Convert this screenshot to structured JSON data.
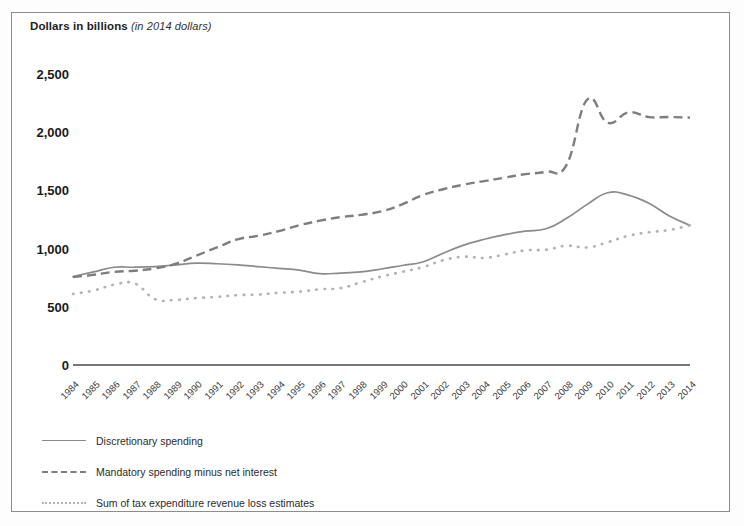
{
  "figure": {
    "axis_title_main": "Dollars in billions",
    "axis_title_units": "(in 2014 dollars)",
    "frame_color": "#8d8d8d",
    "background": "#ffffff"
  },
  "legend": {
    "position": "below-plot",
    "items": [
      {
        "label": "Discretionary spending",
        "marker": "solid-line",
        "color": "#8b8b8b"
      },
      {
        "label": "Mandatory spending minus net interest",
        "marker": "dashed-line",
        "color": "#7e7e7e"
      },
      {
        "label": "Sum of tax expenditure revenue loss estimates",
        "marker": "dotted-line",
        "color": "#b2b2b2"
      }
    ]
  },
  "chart_data": {
    "type": "line",
    "title": "Dollars in billions (in 2014 dollars)",
    "xlabel": "",
    "ylabel": "Dollars in billions",
    "ylim": [
      0,
      2500
    ],
    "yticks": [
      "0",
      "500",
      "1,000",
      "1,500",
      "2,000",
      "2,500"
    ],
    "ytick_values": [
      0,
      500,
      1000,
      1500,
      2000,
      2500
    ],
    "grid": false,
    "legend_position": "below",
    "x": [
      "1984",
      "1985",
      "1986",
      "1987",
      "1988",
      "1989",
      "1990",
      "1991",
      "1992",
      "1993",
      "1994",
      "1995",
      "1996",
      "1997",
      "1998",
      "1999",
      "2000",
      "2001",
      "2002",
      "2003",
      "2004",
      "2005",
      "2006",
      "2007",
      "2008",
      "2009",
      "2010",
      "2011",
      "2012",
      "2013",
      "2014"
    ],
    "series": [
      {
        "name": "Discretionary spending",
        "style": "solid",
        "color": "#8b8b8b",
        "values": [
          760,
          800,
          840,
          840,
          845,
          860,
          875,
          870,
          860,
          845,
          830,
          815,
          785,
          790,
          800,
          825,
          855,
          885,
          960,
          1030,
          1080,
          1120,
          1150,
          1170,
          1260,
          1380,
          1480,
          1460,
          1390,
          1280,
          1200
        ]
      },
      {
        "name": "Mandatory spending minus net interest",
        "style": "dashed",
        "color": "#7e7e7e",
        "values": [
          755,
          775,
          800,
          810,
          830,
          870,
          940,
          1010,
          1080,
          1110,
          1150,
          1200,
          1240,
          1270,
          1290,
          1320,
          1380,
          1460,
          1510,
          1550,
          1580,
          1610,
          1640,
          1660,
          1720,
          2280,
          2080,
          2170,
          2130,
          2130,
          2125
        ]
      },
      {
        "name": "Sum of tax expenditure revenue loss estimates",
        "style": "dotted",
        "color": "#b2b2b2",
        "values": [
          610,
          640,
          690,
          700,
          565,
          560,
          575,
          585,
          600,
          605,
          620,
          630,
          650,
          660,
          710,
          760,
          800,
          840,
          900,
          930,
          920,
          950,
          985,
          990,
          1025,
          1010,
          1055,
          1110,
          1140,
          1160,
          1200
        ]
      }
    ]
  },
  "geometry": {
    "plot_left": 62,
    "plot_right": 679,
    "y_zero": 353,
    "y_per_unit": 0.1212
  }
}
